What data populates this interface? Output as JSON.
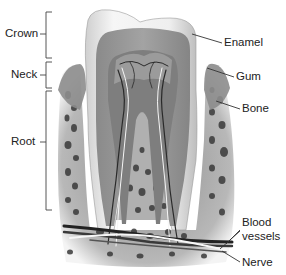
{
  "diagram": {
    "left_labels": [
      {
        "id": "crown",
        "text": "Crown"
      },
      {
        "id": "neck",
        "text": "Neck"
      },
      {
        "id": "root",
        "text": "Root"
      }
    ],
    "right_labels": [
      {
        "id": "enamel",
        "text": "Enamel"
      },
      {
        "id": "gum",
        "text": "Gum"
      },
      {
        "id": "bone",
        "text": "Bone"
      },
      {
        "id": "blood_vessels_line1",
        "text": "Blood"
      },
      {
        "id": "blood_vessels_line2",
        "text": "vessels"
      },
      {
        "id": "nerve",
        "text": "Nerve"
      }
    ]
  },
  "colors": {
    "background": "#ffffff",
    "text": "#222222",
    "leader_line": "#333333",
    "enamel": "#e9e9e9",
    "dentin": "#9a9a9a",
    "pulp": "#7c7c7c",
    "bone": "#b5b5b5",
    "bone_pores": "#3a3a3a"
  }
}
